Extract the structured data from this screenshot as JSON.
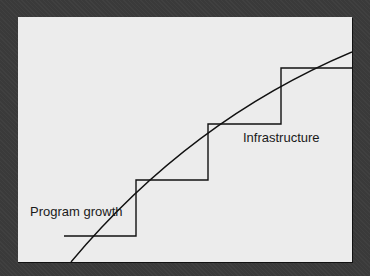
{
  "diagram": {
    "labels": {
      "curve": "Program growth",
      "steps": "Infrastructure"
    },
    "colors": {
      "background": "#3a3a3a",
      "panel": "#ececec",
      "line": "#111111"
    },
    "series": [
      {
        "name": "Program growth",
        "kind": "smooth-curve"
      },
      {
        "name": "Infrastructure",
        "kind": "step-function",
        "steps": 4
      }
    ]
  }
}
